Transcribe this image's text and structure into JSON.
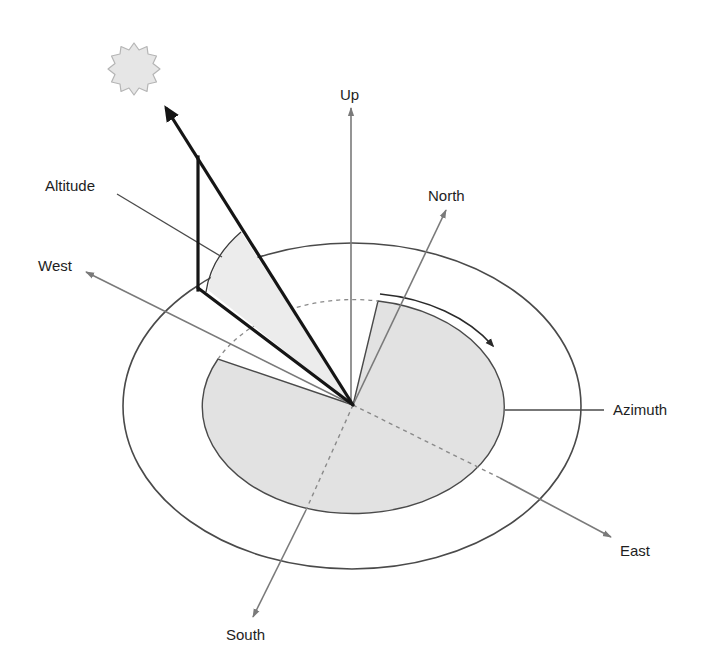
{
  "diagram": {
    "labels": {
      "up": "Up",
      "north": "North",
      "west": "West",
      "east": "East",
      "south": "South",
      "altitude": "Altitude",
      "azimuth": "Azimuth"
    },
    "colors": {
      "background": "#ffffff",
      "axis_gray": "#7a7a7a",
      "outline": "#4a4a4a",
      "sun_vector": "#151515",
      "ground_fill": "#e2e2e2",
      "altitude_fill": "#ececec",
      "sun_fill": "#e6e6e6",
      "sun_stroke": "#b5b5b5"
    },
    "elements": {
      "sun": "sun-icon",
      "observer_center": "origin",
      "horizon_outer": "outer-ellipse",
      "horizon_inner": "azimuth-disc"
    }
  }
}
